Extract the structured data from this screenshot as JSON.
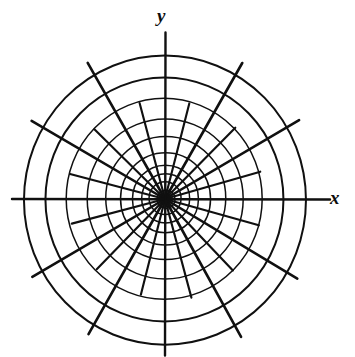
{
  "figure": {
    "type": "polar-grid-diagram",
    "title": "",
    "background_color": "#ffffff",
    "ink_color": "#101010"
  },
  "axes": {
    "x_label": "x",
    "y_label": "y",
    "x_axis_name": "x-axis",
    "y_axis_name": "y-axis"
  },
  "chart_data": {
    "type": "polar-grid",
    "title": "",
    "xlabel": "x",
    "ylabel": "y",
    "grid": true,
    "legend": null,
    "center": {
      "x": 165,
      "y": 199
    },
    "outer_radius": 141,
    "circle_count": 10,
    "circle_radii": [
      9,
      16,
      24,
      33,
      45,
      60,
      78,
      98,
      119,
      141
    ],
    "spoke_count": 24,
    "spoke_angles_deg": [
      0,
      15,
      30,
      45,
      60,
      75,
      90,
      105,
      120,
      135,
      150,
      165,
      180,
      195,
      210,
      225,
      240,
      255,
      270,
      285,
      300,
      315,
      330,
      345
    ],
    "long_spoke_angles_deg": [
      0,
      30,
      60,
      90,
      120,
      150,
      180,
      210,
      240,
      270,
      300,
      330
    ],
    "short_spoke_angles_deg": [
      15,
      45,
      75,
      105,
      135,
      165,
      195,
      225,
      255,
      285,
      315,
      345
    ],
    "short_spoke_radius": 98,
    "long_spoke_overshoot": 13,
    "axis_overshoot": 12,
    "stroke_width_circle": 1.5,
    "stroke_width_spoke": 2.6,
    "stroke_width_axis": 2.4
  }
}
